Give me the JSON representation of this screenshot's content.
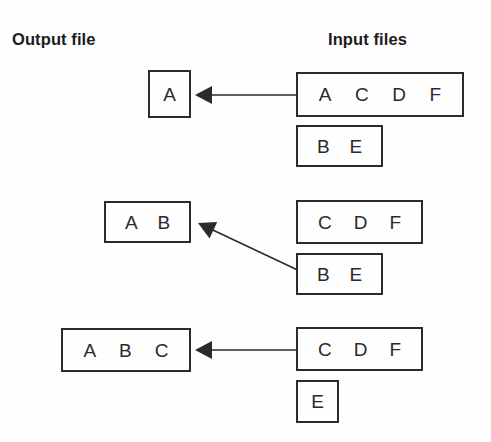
{
  "headers": {
    "output": "Output file",
    "input": "Input files"
  },
  "colors": {
    "stroke": "#2b2b2b",
    "text": "#2a2a2a",
    "background": "#fefefe",
    "header_text": "#1c1c1c"
  },
  "rows": [
    {
      "id": "row-1",
      "output_box": {
        "records": [
          "A"
        ],
        "x": 148,
        "y": 70,
        "w": 43,
        "h": 48
      },
      "input_boxes": [
        {
          "records": [
            "A",
            "C",
            "D",
            "F"
          ],
          "x": 296,
          "y": 72,
          "w": 168,
          "h": 45
        },
        {
          "records": [
            "B",
            "E"
          ],
          "x": 296,
          "y": 125,
          "w": 87,
          "h": 42
        }
      ],
      "arrow": {
        "type": "straight",
        "x1": 301,
        "y1": 95,
        "x2": 195,
        "y2": 95
      }
    },
    {
      "id": "row-2",
      "output_box": {
        "records": [
          "A",
          "B"
        ],
        "x": 104,
        "y": 201,
        "w": 87,
        "h": 42
      },
      "input_boxes": [
        {
          "records": [
            "C",
            "D",
            "F"
          ],
          "x": 296,
          "y": 200,
          "w": 127,
          "h": 44
        },
        {
          "records": [
            "B",
            "E"
          ],
          "x": 296,
          "y": 253,
          "w": 87,
          "h": 42
        }
      ],
      "arrow": {
        "type": "diagonal",
        "x1": 304,
        "y1": 273,
        "x2": 198,
        "y2": 223
      }
    },
    {
      "id": "row-3",
      "output_box": {
        "records": [
          "A",
          "B",
          "C"
        ],
        "x": 61,
        "y": 328,
        "w": 130,
        "h": 44
      },
      "input_boxes": [
        {
          "records": [
            "C",
            "D",
            "F"
          ],
          "x": 296,
          "y": 327,
          "w": 127,
          "h": 44
        },
        {
          "records": [
            "E"
          ],
          "x": 296,
          "y": 380,
          "w": 43,
          "h": 43
        }
      ],
      "arrow": {
        "type": "straight",
        "x1": 301,
        "y1": 350,
        "x2": 195,
        "y2": 350
      }
    }
  ]
}
